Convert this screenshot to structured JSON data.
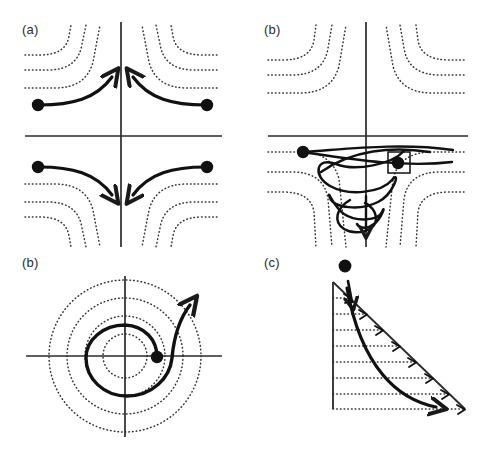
{
  "figure": {
    "background_color": "#ffffff",
    "stroke_color": "#1a1a1a",
    "dotted_color": "#333333",
    "width": 485,
    "height": 451
  },
  "panels": [
    {
      "id": "a",
      "label": "(a)",
      "type": "saddle-point-flow",
      "axes": {
        "origin_x": 121,
        "origin_y": 136,
        "x_min": 25,
        "x_max": 222,
        "y_min": 22,
        "y_max": 240
      },
      "dotted_family": "hyperbolas",
      "markers": [
        {
          "shape": "dot",
          "x": 38,
          "y": 105
        },
        {
          "shape": "dot",
          "x": 207,
          "y": 105
        },
        {
          "shape": "dot",
          "x": 38,
          "y": 167
        },
        {
          "shape": "dot",
          "x": 207,
          "y": 167
        }
      ],
      "trajectories": 4,
      "arrow_directions": [
        "up-right",
        "up-left",
        "down-right",
        "down-left"
      ]
    },
    {
      "id": "b-top",
      "label": "(b)",
      "type": "saddle-with-helix",
      "axes": {
        "origin_x": 366,
        "origin_y": 136,
        "x_min": 268,
        "x_max": 468,
        "y_min": 22,
        "y_max": 245
      },
      "dotted_family": "hyperbolas",
      "markers": [
        {
          "shape": "dot",
          "x": 303,
          "y": 152
        },
        {
          "shape": "dot",
          "x": 398,
          "y": 163,
          "boxed": true
        }
      ],
      "helix": {
        "turns": 4,
        "top_y": 150,
        "bottom_y": 230,
        "center_x": 366
      },
      "arrow_directions": [
        "down"
      ]
    },
    {
      "id": "b-bottom",
      "label": "(b)",
      "type": "spiral-source",
      "axes": {
        "origin_x": 125,
        "origin_y": 356,
        "x_min": 26,
        "x_max": 222,
        "y_min": 276,
        "y_max": 437
      },
      "dotted_family": "concentric-circles",
      "circle_radii": [
        22,
        40,
        58,
        76
      ],
      "markers": [
        {
          "shape": "dot",
          "x": 157,
          "y": 357
        }
      ],
      "spiral_turns": 1.6,
      "arrow_directions": [
        "up"
      ]
    },
    {
      "id": "c",
      "label": "(c)",
      "type": "wedge-shear",
      "triangle": {
        "apex_x": 333,
        "apex_y": 282,
        "base_left_x": 333,
        "base_y": 409,
        "base_right_x": 465
      },
      "dotted_family": "horizontal-lines",
      "dotted_line_count": 8,
      "markers": [
        {
          "shape": "dot",
          "x": 345,
          "y": 266
        }
      ],
      "arrow_directions": [
        "down",
        "down-right"
      ]
    }
  ]
}
